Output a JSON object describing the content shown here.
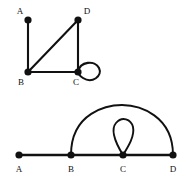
{
  "figure": {
    "title": "",
    "background_color": "#ffffff",
    "ink_color": "#111111",
    "width": 195,
    "height": 185,
    "graphs": [
      {
        "id": "top-graph",
        "name": "square-with-diagonal-and-loop",
        "description": "Graph on vertices A, B, C, D drawn as a square arrangement with a diagonal from B to D and a self-loop at C.",
        "vertices": [
          {
            "id": "A",
            "label": "A",
            "x": 28,
            "y": 20,
            "label_x": 20,
            "label_y": 14,
            "label_anchor": "middle"
          },
          {
            "id": "B",
            "label": "B",
            "x": 28,
            "y": 72,
            "label_x": 21,
            "label_y": 85,
            "label_anchor": "middle"
          },
          {
            "id": "C",
            "label": "C",
            "x": 78,
            "y": 72,
            "label_x": 76,
            "label_y": 85,
            "label_anchor": "middle"
          },
          {
            "id": "D",
            "label": "D",
            "x": 78,
            "y": 20,
            "label_x": 87,
            "label_y": 14,
            "label_anchor": "middle"
          }
        ],
        "edges": [
          {
            "id": "AB",
            "from": "A",
            "to": "B",
            "kind": "line"
          },
          {
            "id": "BD",
            "from": "B",
            "to": "D",
            "kind": "line"
          },
          {
            "id": "DC",
            "from": "D",
            "to": "C",
            "kind": "line"
          },
          {
            "id": "BC",
            "from": "B",
            "to": "C",
            "kind": "line"
          },
          {
            "id": "CC",
            "from": "C",
            "to": "C",
            "kind": "loop",
            "direction": "right"
          }
        ],
        "degrees": {
          "A": 1,
          "B": 3,
          "C": 4,
          "D": 2
        }
      },
      {
        "id": "bottom-graph",
        "name": "path-with-arc-and-loop",
        "description": "Graph on vertices A, B, C, D drawn collinear with a path A-B-C-D, a large arc from B to D, and a self-loop at C.",
        "vertices": [
          {
            "id": "A",
            "label": "A",
            "x": 19,
            "y": 155,
            "label_x": 19,
            "label_y": 172,
            "label_anchor": "middle"
          },
          {
            "id": "B",
            "label": "B",
            "x": 71,
            "y": 155,
            "label_x": 71,
            "label_y": 172,
            "label_anchor": "middle"
          },
          {
            "id": "C",
            "label": "C",
            "x": 123,
            "y": 155,
            "label_x": 123,
            "label_y": 172,
            "label_anchor": "middle"
          },
          {
            "id": "D",
            "label": "D",
            "x": 173,
            "y": 155,
            "label_x": 173,
            "label_y": 172,
            "label_anchor": "middle"
          }
        ],
        "edges": [
          {
            "id": "AB",
            "from": "A",
            "to": "B",
            "kind": "line"
          },
          {
            "id": "BC",
            "from": "B",
            "to": "C",
            "kind": "line"
          },
          {
            "id": "CD",
            "from": "C",
            "to": "D",
            "kind": "line"
          },
          {
            "id": "BD-arc",
            "from": "B",
            "to": "D",
            "kind": "arc",
            "direction": "up"
          },
          {
            "id": "CC",
            "from": "C",
            "to": "C",
            "kind": "loop",
            "direction": "up"
          }
        ],
        "degrees": {
          "A": 1,
          "B": 3,
          "C": 4,
          "D": 2
        }
      }
    ],
    "labels": {
      "A": "A",
      "B": "B",
      "C": "C",
      "D": "D"
    }
  }
}
